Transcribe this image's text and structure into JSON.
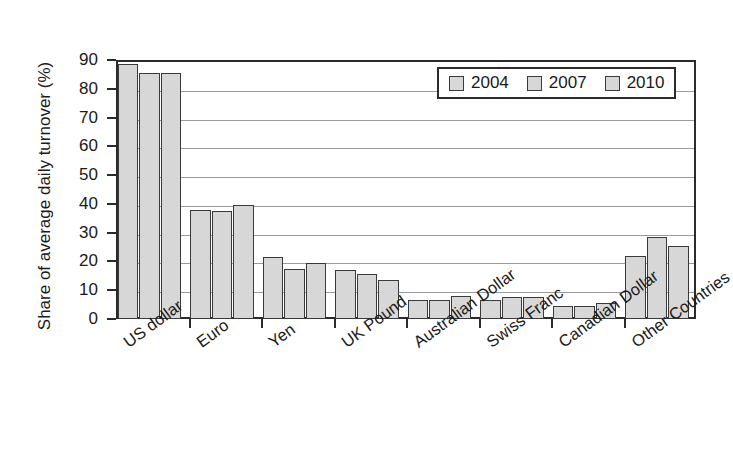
{
  "chart_data": {
    "type": "bar",
    "title": "",
    "xlabel": "",
    "ylabel": "Share of average daily turnover (%)",
    "ylim": [
      0,
      90
    ],
    "yticks": [
      0,
      10,
      20,
      30,
      40,
      50,
      60,
      70,
      80,
      90
    ],
    "ytick_labels": [
      "0",
      "10",
      "20",
      "30",
      "40",
      "50",
      "60",
      "70",
      "80",
      "90"
    ],
    "grid": true,
    "legend_position": "top-right",
    "categories": [
      "US dollar",
      "Euro",
      "Yen",
      "UK Pound",
      "Australian Dollar",
      "Swiss Franc",
      "Canadian Dollar",
      "Other Countries"
    ],
    "series": [
      {
        "name": "2004",
        "color": "#d7d7d7",
        "values": [
          88.5,
          38.0,
          21.5,
          17.0,
          6.5,
          6.5,
          4.5,
          22.0
        ]
      },
      {
        "name": "2007",
        "color": "#d7d7d7",
        "values": [
          85.5,
          37.5,
          17.5,
          15.5,
          6.5,
          7.5,
          4.5,
          28.5
        ]
      },
      {
        "name": "2010",
        "color": "#d7d7d7",
        "values": [
          85.5,
          39.5,
          19.5,
          13.5,
          8.0,
          7.5,
          5.5,
          25.5
        ]
      }
    ]
  },
  "legend": {
    "items": [
      {
        "label": "2004"
      },
      {
        "label": "2007"
      },
      {
        "label": "2010"
      }
    ]
  },
  "colors": {
    "bar_fill": "#d7d7d7",
    "bar_stroke": "#3a3a3a",
    "axis": "#2b2b2b",
    "gridline": "#9a9a9a",
    "background": "#ffffff",
    "text": "#1a1a1a"
  }
}
